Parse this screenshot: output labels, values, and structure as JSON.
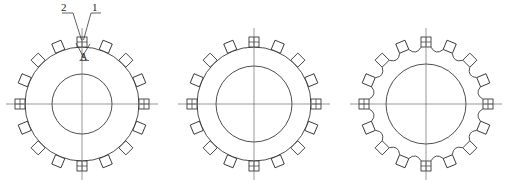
{
  "sheet": {
    "title": "Gear Ring Technical Drawing",
    "background_color": "#ffffff",
    "line_color": "#2e2e2e",
    "centerline_color": "#6a6a6a",
    "width": 508,
    "height": 189
  },
  "callouts": [
    {
      "id": "callout-2",
      "label": "2"
    },
    {
      "id": "callout-1",
      "label": "1"
    },
    {
      "id": "callout-a",
      "label": "A"
    }
  ],
  "figures": [
    {
      "name": "figure-left",
      "center_x": 82,
      "center_y": 104,
      "outer_radius": 57,
      "bore_radius": 30,
      "tooth_count": 16,
      "tooth_size": 10,
      "profile": "plain-circle",
      "has_callouts": true
    },
    {
      "name": "figure-middle",
      "center_x": 254,
      "center_y": 104,
      "outer_radius": 57,
      "bore_radius": 38,
      "tooth_count": 16,
      "tooth_size": 10,
      "profile": "plain-circle",
      "has_callouts": false
    },
    {
      "name": "figure-right",
      "center_x": 426,
      "center_y": 104,
      "outer_radius": 57,
      "bore_radius": 40,
      "tooth_count": 16,
      "tooth_size": 10,
      "profile": "scalloped",
      "has_callouts": false
    }
  ]
}
